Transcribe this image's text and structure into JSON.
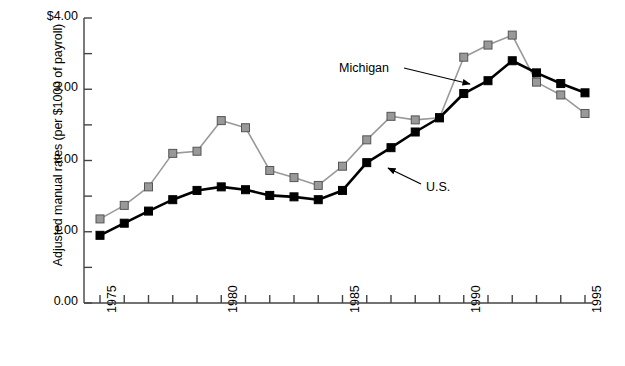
{
  "chart_data": {
    "type": "line",
    "title": "",
    "xlabel": "",
    "ylabel": "Adjusted manual rates (per $1000 of payroll)",
    "xlim": [
      1975,
      1995
    ],
    "ylim": [
      0.0,
      4.0
    ],
    "grid": false,
    "legend_position": "inline-annotations",
    "x": [
      1975,
      1976,
      1977,
      1978,
      1979,
      1980,
      1981,
      1982,
      1983,
      1984,
      1985,
      1986,
      1987,
      1988,
      1989,
      1990,
      1991,
      1992,
      1993,
      1994,
      1995
    ],
    "ytick_labels": [
      "0.00",
      "1.00",
      "2.00",
      "3.00",
      "$4.00"
    ],
    "ytick_values": [
      0.0,
      1.0,
      2.0,
      3.0,
      4.0
    ],
    "yminor_tick_values": [
      0.5,
      1.5,
      2.5,
      3.5
    ],
    "xtick_labels": [
      "1975",
      "1980",
      "1985",
      "1990",
      "1995"
    ],
    "xtick_values": [
      1975,
      1980,
      1985,
      1990,
      1995
    ],
    "series": [
      {
        "name": "Michigan",
        "color": "#999999",
        "marker": "square",
        "marker_edge": "#555555",
        "values": [
          1.18,
          1.37,
          1.63,
          2.1,
          2.13,
          2.56,
          2.46,
          1.86,
          1.76,
          1.65,
          1.92,
          2.29,
          2.62,
          2.57,
          2.6,
          3.45,
          3.62,
          3.76,
          3.1,
          2.92,
          2.66
        ]
      },
      {
        "name": "U.S.",
        "color": "#000000",
        "marker": "square",
        "marker_edge": "#000000",
        "values": [
          0.95,
          1.12,
          1.29,
          1.45,
          1.58,
          1.63,
          1.59,
          1.51,
          1.49,
          1.45,
          1.58,
          1.97,
          2.18,
          2.4,
          2.6,
          2.94,
          3.12,
          3.4,
          3.23,
          3.08,
          2.95
        ]
      }
    ],
    "annotations": [
      {
        "text": "Michigan",
        "target_series": "Michigan",
        "target_x": 1990
      },
      {
        "text": "U.S.",
        "target_series": "U.S.",
        "target_x": 1989
      }
    ]
  }
}
